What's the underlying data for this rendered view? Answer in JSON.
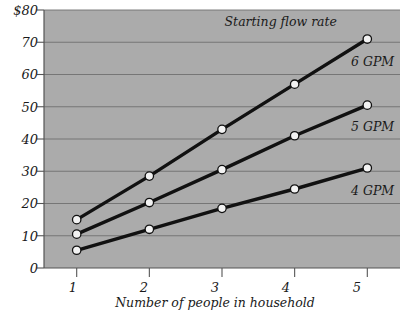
{
  "chart_data": {
    "type": "line",
    "title": "",
    "annotation": "Starting flow rate",
    "xlabel": "Number of people in household",
    "ylabel": "",
    "x": [
      1,
      2,
      3,
      4,
      5
    ],
    "xticklabels": [
      "1",
      "2",
      "3",
      "4",
      "5"
    ],
    "xlim": [
      0.55,
      5.45
    ],
    "ylim": [
      0,
      80
    ],
    "yticks": [
      0,
      10,
      20,
      30,
      40,
      50,
      60,
      70,
      80
    ],
    "yticklabels": [
      "0",
      "10",
      "20",
      "30",
      "40",
      "50",
      "60",
      "70",
      "$80"
    ],
    "grid": "horizontal",
    "legend_position": "inline-right-of-line-end",
    "plot_background": "#ababab",
    "line_color": "#111111",
    "marker_face": "#f2f2f2",
    "marker_edge": "#111111",
    "gridline_color": "#6f6f6f",
    "series": [
      {
        "name": "6 GPM",
        "values": [
          15,
          28.5,
          43,
          57,
          71
        ],
        "label_value": "6 GPM"
      },
      {
        "name": "5 GPM",
        "values": [
          10.5,
          20.3,
          30.5,
          41,
          50.5
        ],
        "label_value": "5 GPM"
      },
      {
        "name": "4 GPM",
        "values": [
          5.5,
          12,
          18.5,
          24.5,
          31
        ],
        "label_value": "4 GPM"
      }
    ]
  },
  "labels": {
    "y_80": "$80",
    "y_70": "70",
    "y_60": "60",
    "y_50": "50",
    "y_40": "40",
    "y_30": "30",
    "y_20": "20",
    "y_10": "10",
    "y_0": "0",
    "x_1": "1",
    "x_2": "2",
    "x_3": "3",
    "x_4": "4",
    "x_5": "5",
    "x_axis_title": "Number of people in household",
    "annotation": "Starting flow rate",
    "series_6": "6 GPM",
    "series_5": "5 GPM",
    "series_4": "4 GPM"
  }
}
